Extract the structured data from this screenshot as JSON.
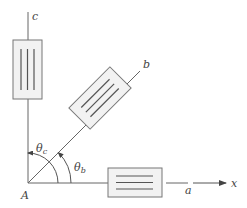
{
  "diagram": {
    "origin_label": "A",
    "axis_label": "x",
    "gauges": [
      {
        "id": "a",
        "label": "a",
        "angle_deg": 0
      },
      {
        "id": "b",
        "label": "b",
        "angle_deg": 45
      },
      {
        "id": "c",
        "label": "c",
        "angle_deg": 90
      }
    ],
    "angles": [
      {
        "id": "theta_b",
        "symbol": "θ",
        "subscript": "b"
      },
      {
        "id": "theta_c",
        "symbol": "θ",
        "subscript": "c"
      }
    ],
    "colors": {
      "line": "#555555",
      "gauge_fill": "#f2f2f2",
      "gauge_border": "#777777",
      "grid_lines": "#555555",
      "text": "#444444"
    }
  }
}
